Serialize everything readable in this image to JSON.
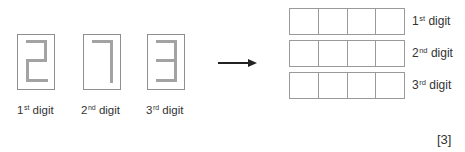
{
  "seven_segment_digits": [
    {
      "value": "2",
      "label_num": "1",
      "label_sup": "st",
      "label_word": "digit",
      "segments": [
        "a",
        "b",
        "g",
        "e",
        "d"
      ]
    },
    {
      "value": "7",
      "label_num": "2",
      "label_sup": "nd",
      "label_word": "digit",
      "segments": [
        "a",
        "b",
        "c"
      ]
    },
    {
      "value": "3",
      "label_num": "3",
      "label_sup": "rd",
      "label_word": "digit",
      "segments": [
        "a",
        "b",
        "g",
        "c",
        "d"
      ]
    }
  ],
  "arrow": {
    "direction": "right",
    "icon": "arrow-right-icon"
  },
  "answer_grid": {
    "rows": [
      {
        "label_num": "1",
        "label_sup": "st",
        "label_word": "digit",
        "cells": [
          "",
          "",
          "",
          ""
        ]
      },
      {
        "label_num": "2",
        "label_sup": "nd",
        "label_word": "digit",
        "cells": [
          "",
          "",
          "",
          ""
        ]
      },
      {
        "label_num": "3",
        "label_sup": "rd",
        "label_word": "digit",
        "cells": [
          "",
          "",
          "",
          ""
        ]
      }
    ]
  },
  "marks": "[3]",
  "colors": {
    "segment": "#a3a3a3",
    "outline": "#8f8f8f",
    "text": "#333333",
    "arrow": "#222222"
  }
}
